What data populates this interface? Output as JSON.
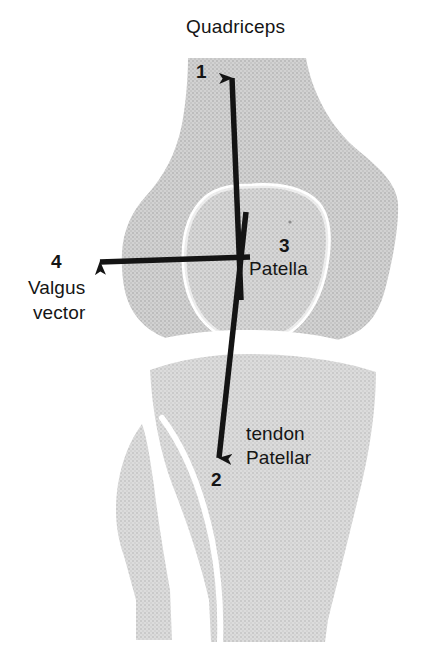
{
  "figure": {
    "kind": "anatomical-diagram",
    "view": "anterior (frontal) view of right knee"
  },
  "title": {
    "text": "Quadriceps"
  },
  "labels": {
    "quadriceps_number": "1",
    "patellar_tendon_number": "2",
    "patella_number": "3",
    "valgus_number": "4",
    "patella_name": "Patella",
    "tendon_line1": "tendon",
    "tendon_line2": "Patellar",
    "valgus_line1": "Valgus",
    "valgus_line2": "vector"
  },
  "vectors": [
    {
      "id": "1",
      "name": "Quadriceps",
      "direction": "superior",
      "from_x": 240,
      "from_y": 300,
      "to_x": 232,
      "to_y": 62
    },
    {
      "id": "2",
      "name": "Patellar tendon",
      "direction": "inferior",
      "from_x": 246,
      "from_y": 210,
      "to_x": 218,
      "to_y": 474
    },
    {
      "id": "3",
      "name": "Patella",
      "direction": "center",
      "from_x": 248,
      "from_y": 257,
      "to_x": 248,
      "to_y": 257
    },
    {
      "id": "4",
      "name": "Valgus vector",
      "direction": "lateral-left",
      "from_x": 248,
      "from_y": 257,
      "to_x": 86,
      "to_y": 262
    }
  ],
  "colors": {
    "bone_fill": "#c9c9c9",
    "bone_fill_light": "#d6d6d6",
    "outline_white": "#ffffff",
    "arrow": "#141414",
    "text": "#151515",
    "background": "#ffffff"
  },
  "structures": [
    {
      "name": "femur",
      "region": "upper"
    },
    {
      "name": "patella",
      "region": "center",
      "outline": "white"
    },
    {
      "name": "tibia",
      "region": "lower-right"
    },
    {
      "name": "fibula",
      "region": "lower-left"
    },
    {
      "name": "joint-space",
      "region": "middle"
    }
  ]
}
